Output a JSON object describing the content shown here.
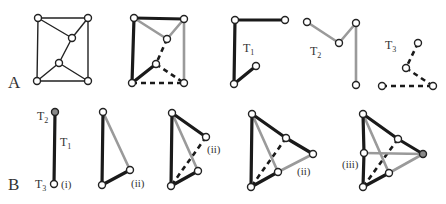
{
  "figure": {
    "row_labels": {
      "A": "A",
      "B": "B"
    },
    "tree_labels": {
      "T1": {
        "main": "T",
        "sub": "1"
      },
      "T2": {
        "main": "T",
        "sub": "2"
      },
      "T3": {
        "main": "T",
        "sub": "3"
      }
    },
    "case_labels": {
      "i": "(i)",
      "ii": "(ii)",
      "iii": "(iii)"
    },
    "edge_styles": {
      "T1": "thick black",
      "T2": "gray",
      "T3": "dashed black"
    },
    "colors": {
      "black_edge": "#1a1a1a",
      "gray_edge": "#9a9a9a",
      "node_fill": "#ffffff",
      "filled_node": "#8a8a8a"
    },
    "panels": [
      {
        "id": "A1",
        "description": "Original planar graph, 6 vertices, 9 edges"
      },
      {
        "id": "A2",
        "description": "Graph decomposed into three trees T1 (black), T2 (gray), T3 (dashed)"
      },
      {
        "id": "A3",
        "description": "Tree T1"
      },
      {
        "id": "A4",
        "description": "Tree T2"
      },
      {
        "id": "A5",
        "description": "Tree T3"
      },
      {
        "id": "B1",
        "description": "Step (i): single edge with T2 and T3 endpoints"
      },
      {
        "id": "B2",
        "description": "Step (ii): triangle"
      },
      {
        "id": "B3",
        "description": "Step (ii): four vertices"
      },
      {
        "id": "B4",
        "description": "Step (ii): five vertices"
      },
      {
        "id": "B5",
        "description": "Step (iii): six vertices"
      }
    ]
  }
}
